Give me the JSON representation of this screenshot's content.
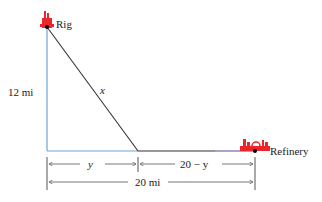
{
  "diagram": {
    "rig_label": "Rig",
    "refinery_label": "Refinery",
    "vertical_distance": "12 mi",
    "hypotenuse_label": "x",
    "segment_y": "y",
    "segment_remaining": "20 − y",
    "total_distance": "20 mi",
    "colors": {
      "water_lines": "#6aa6d8",
      "land_line": "#4a4aa0",
      "pipe_line": "#333333",
      "icons": "#e8262b"
    }
  }
}
